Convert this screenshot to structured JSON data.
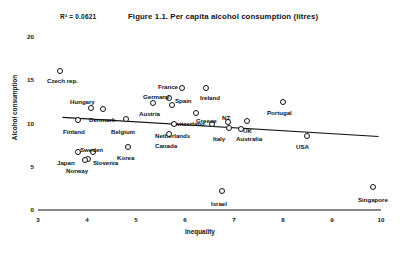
{
  "figure": {
    "title": "Figure 1.1. Per capita alcohol consumption (litres)",
    "r2_annotation": "R² = 0.0621"
  },
  "axes": {
    "xlabel": "Inequality",
    "ylabel": "Alcohol consumption",
    "xticks": [
      "3",
      "4",
      "5",
      "6",
      "7",
      "8",
      "9",
      "10"
    ],
    "yticks": [
      "0",
      "5",
      "10",
      "15",
      "20"
    ]
  },
  "chart_data": {
    "type": "scatter",
    "title": "Figure 1.1. Per capita alcohol consumption (litres)",
    "xlabel": "Inequality",
    "ylabel": "Alcohol consumption",
    "xlim": [
      3,
      10
    ],
    "ylim": [
      0,
      20
    ],
    "xticks": [
      3,
      4,
      5,
      6,
      7,
      8,
      9,
      10
    ],
    "yticks": [
      0,
      5,
      10,
      15,
      20
    ],
    "grid": false,
    "legend": false,
    "r_squared": 0.0621,
    "annotations": [
      "R² = 0.0621"
    ],
    "trendline": {
      "type": "linear",
      "x_start": 3.5,
      "y_start": 10.7,
      "x_end": 9.95,
      "y_end": 8.5,
      "r_squared": 0.0621
    },
    "points": [
      {
        "label": "Czech rep.",
        "x": 3.6,
        "y": 15.9,
        "px": 60,
        "py": 71,
        "lx": 47,
        "ly": 77
      },
      {
        "label": "Hungary",
        "x": 4.2,
        "y": 11.6,
        "px": 91,
        "py": 108,
        "lx": 70,
        "ly": 98
      },
      {
        "label": "Denmark",
        "x": 4.4,
        "y": 11.5,
        "px": 103,
        "py": 109,
        "lx": 89,
        "ly": 116
      },
      {
        "label": "Austria",
        "x": 5.5,
        "y": 12.1,
        "px": 153,
        "py": 103,
        "lx": 139,
        "ly": 110
      },
      {
        "label": "Germany",
        "x": 5.8,
        "y": 12.6,
        "px": 169,
        "py": 98,
        "lx": 143,
        "ly": 93
      },
      {
        "label": "Spain",
        "x": 5.9,
        "y": 11.9,
        "px": 172,
        "py": 105,
        "lx": 175,
        "ly": 97
      },
      {
        "label": "France",
        "x": 6.1,
        "y": 13.3,
        "px": 182,
        "py": 88,
        "lx": 158,
        "ly": 83
      },
      {
        "label": "Ireland",
        "x": 6.6,
        "y": 13.3,
        "px": 206,
        "py": 88,
        "lx": 200,
        "ly": 94
      },
      {
        "label": "Switzerland",
        "x": 6.4,
        "y": 11.2,
        "px": 196,
        "py": 113,
        "lx": 171,
        "ly": 120
      },
      {
        "label": "Finland",
        "x": 3.9,
        "y": 10.2,
        "px": 78,
        "py": 120,
        "lx": 63,
        "ly": 128
      },
      {
        "label": "Belgium",
        "x": 4.9,
        "y": 10.3,
        "px": 126,
        "py": 119,
        "lx": 111,
        "ly": 128
      },
      {
        "label": "Netherlands",
        "x": 5.9,
        "y": 9.9,
        "px": 174,
        "py": 124,
        "lx": 155,
        "ly": 132
      },
      {
        "label": "Greece",
        "x": 6.7,
        "y": 9.9,
        "px": 212,
        "py": 124,
        "lx": 196,
        "ly": 117
      },
      {
        "label": "NZ",
        "x": 7.0,
        "y": 10.0,
        "px": 228,
        "py": 122,
        "lx": 222,
        "ly": 114
      },
      {
        "label": "UK",
        "x": 7.5,
        "y": 10.1,
        "px": 247,
        "py": 121,
        "lx": 243,
        "ly": 127
      },
      {
        "label": "Italy",
        "x": 7.0,
        "y": 9.4,
        "px": 229,
        "py": 128,
        "lx": 213,
        "ly": 135
      },
      {
        "label": "Australia",
        "x": 7.3,
        "y": 9.3,
        "px": 241,
        "py": 129,
        "lx": 236,
        "ly": 135
      },
      {
        "label": "Canada",
        "x": 5.8,
        "y": 8.7,
        "px": 169,
        "py": 134,
        "lx": 155,
        "ly": 142
      },
      {
        "label": "Portugal",
        "x": 8.0,
        "y": 12.3,
        "px": 283,
        "py": 102,
        "lx": 267,
        "ly": 109
      },
      {
        "label": "USA",
        "x": 8.5,
        "y": 8.5,
        "px": 307,
        "py": 136,
        "lx": 296,
        "ly": 143
      },
      {
        "label": "Japan",
        "x": 3.9,
        "y": 6.7,
        "px": 78,
        "py": 152,
        "lx": 57,
        "ly": 159
      },
      {
        "label": "Sweden",
        "x": 4.2,
        "y": 6.6,
        "px": 93,
        "py": 152,
        "lx": 80,
        "ly": 146
      },
      {
        "label": "Slovenia",
        "x": 4.1,
        "y": 6.0,
        "px": 88,
        "py": 159,
        "lx": 93,
        "ly": 159
      },
      {
        "label": "Norway",
        "x": 4.0,
        "y": 5.9,
        "px": 85,
        "py": 160,
        "lx": 66,
        "ly": 167
      },
      {
        "label": "Korea",
        "x": 4.9,
        "y": 7.2,
        "px": 128,
        "py": 147,
        "lx": 117,
        "ly": 154
      },
      {
        "label": "Israel",
        "x": 6.8,
        "y": 2.2,
        "px": 222,
        "py": 191,
        "lx": 211,
        "ly": 200
      },
      {
        "label": "Singapore",
        "x": 9.9,
        "y": 2.6,
        "px": 373,
        "py": 187,
        "lx": 358,
        "ly": 196
      }
    ]
  }
}
